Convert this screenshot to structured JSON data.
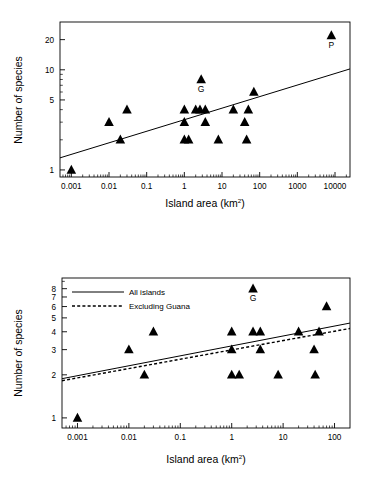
{
  "figure": {
    "background": "#ffffff",
    "marker_color": "#000000",
    "line_color": "#000000"
  },
  "chart_data": [
    {
      "type": "scatter",
      "panel": "top",
      "title": "",
      "xlabel": "Island area (km2)",
      "xlabel_base": "Island area (km",
      "xlabel_sup": "2",
      "xlabel_tail": ")",
      "ylabel": "Number of species",
      "xscale": "log",
      "yscale": "log",
      "xlim": [
        0.0005,
        25000
      ],
      "ylim": [
        0.85,
        30
      ],
      "xticks": [
        0.001,
        0.01,
        0.1,
        1,
        10,
        100,
        1000,
        10000
      ],
      "xticklabels": [
        "0.001",
        "0.01",
        "0.1",
        "1",
        "10",
        "100",
        "1000",
        "10000"
      ],
      "yticks": [
        1,
        5,
        10,
        20
      ],
      "yticklabels": [
        "1",
        "5",
        "10",
        "20"
      ],
      "grid": false,
      "legend": null,
      "points": [
        {
          "x": 0.001,
          "y": 1,
          "label": ""
        },
        {
          "x": 0.01,
          "y": 3,
          "label": ""
        },
        {
          "x": 0.02,
          "y": 2,
          "label": ""
        },
        {
          "x": 0.03,
          "y": 4,
          "label": ""
        },
        {
          "x": 1.0,
          "y": 3,
          "label": ""
        },
        {
          "x": 1.0,
          "y": 4,
          "label": ""
        },
        {
          "x": 1.0,
          "y": 2,
          "label": ""
        },
        {
          "x": 1.3,
          "y": 2,
          "label": ""
        },
        {
          "x": 2.0,
          "y": 4,
          "label": ""
        },
        {
          "x": 2.6,
          "y": 4,
          "label": ""
        },
        {
          "x": 2.8,
          "y": 8,
          "label": "G"
        },
        {
          "x": 3.6,
          "y": 4,
          "label": ""
        },
        {
          "x": 3.6,
          "y": 3,
          "label": ""
        },
        {
          "x": 8.0,
          "y": 2,
          "label": ""
        },
        {
          "x": 20.0,
          "y": 4,
          "label": ""
        },
        {
          "x": 40.0,
          "y": 3,
          "label": ""
        },
        {
          "x": 45.0,
          "y": 2,
          "label": ""
        },
        {
          "x": 50.0,
          "y": 4,
          "label": ""
        },
        {
          "x": 70.0,
          "y": 6,
          "label": ""
        },
        {
          "x": 8000.0,
          "y": 22,
          "label": "P"
        }
      ],
      "fit_lines": [
        {
          "name": "All islands",
          "style": "solid",
          "x0": 0.0005,
          "y0": 1.32,
          "x1": 25000,
          "y1": 10.2
        }
      ]
    },
    {
      "type": "scatter",
      "panel": "bottom",
      "title": "",
      "xlabel": "Island area (km2)",
      "xlabel_base": "Island area (km",
      "xlabel_sup": "2",
      "xlabel_tail": ")",
      "ylabel": "Number of species",
      "xscale": "log",
      "yscale": "log",
      "xlim": [
        0.0005,
        200
      ],
      "ylim": [
        0.85,
        9.5
      ],
      "xticks": [
        0.001,
        0.01,
        0.1,
        1,
        10,
        100
      ],
      "xticklabels": [
        "0.001",
        "0.01",
        "0.1",
        "1",
        "10",
        "100"
      ],
      "yticks": [
        1,
        2,
        3,
        4,
        5,
        6,
        7,
        8
      ],
      "yticklabels": [
        "1",
        "2",
        "3",
        "4",
        "5",
        "6",
        "7",
        "8"
      ],
      "grid": false,
      "legend": {
        "position": "top-left",
        "entries": [
          {
            "label": "All islands",
            "style": "solid"
          },
          {
            "label": "Excluding Guana",
            "style": "dashed"
          }
        ]
      },
      "points": [
        {
          "x": 0.001,
          "y": 1,
          "label": ""
        },
        {
          "x": 0.01,
          "y": 3,
          "label": ""
        },
        {
          "x": 0.02,
          "y": 2,
          "label": ""
        },
        {
          "x": 0.03,
          "y": 4,
          "label": ""
        },
        {
          "x": 1.0,
          "y": 4,
          "label": ""
        },
        {
          "x": 1.0,
          "y": 3,
          "label": ""
        },
        {
          "x": 1.0,
          "y": 2,
          "label": ""
        },
        {
          "x": 1.4,
          "y": 2,
          "label": ""
        },
        {
          "x": 2.6,
          "y": 8,
          "label": "G"
        },
        {
          "x": 2.6,
          "y": 4,
          "label": ""
        },
        {
          "x": 3.6,
          "y": 4,
          "label": ""
        },
        {
          "x": 3.6,
          "y": 3,
          "label": ""
        },
        {
          "x": 8.0,
          "y": 2,
          "label": ""
        },
        {
          "x": 20.0,
          "y": 4,
          "label": ""
        },
        {
          "x": 40.0,
          "y": 3,
          "label": ""
        },
        {
          "x": 42.0,
          "y": 2,
          "label": ""
        },
        {
          "x": 50.0,
          "y": 4,
          "label": ""
        },
        {
          "x": 70.0,
          "y": 6,
          "label": ""
        }
      ],
      "fit_lines": [
        {
          "name": "All islands",
          "style": "solid",
          "x0": 0.0005,
          "y0": 1.88,
          "x1": 200,
          "y1": 4.6
        },
        {
          "name": "Excluding Guana",
          "style": "dashed",
          "x0": 0.0005,
          "y0": 1.82,
          "x1": 200,
          "y1": 4.22
        }
      ]
    }
  ]
}
